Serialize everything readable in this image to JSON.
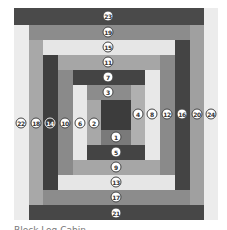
{
  "diagram": {
    "type": "log-cabin-quilt-block",
    "caption": "Block Log Cabin",
    "center": {
      "x": 101,
      "y": 100,
      "w": 30,
      "h": 30,
      "color": "#3c3c3c"
    },
    "strips": [
      {
        "n": "24",
        "x": 204,
        "y": 8,
        "w": 14,
        "h": 212,
        "color": "#ececec",
        "lx": 211,
        "ly": 114
      },
      {
        "n": "23",
        "x": 14,
        "y": 8,
        "w": 190,
        "h": 17,
        "color": "#4a4a4a",
        "lx": 108,
        "ly": 16
      },
      {
        "n": "22",
        "x": 14,
        "y": 25,
        "w": 15,
        "h": 195,
        "color": "#ececec",
        "lx": 21,
        "ly": 123
      },
      {
        "n": "21",
        "x": 29,
        "y": 205,
        "w": 175,
        "h": 15,
        "color": "#474747",
        "lx": 116,
        "ly": 213
      },
      {
        "n": "20",
        "x": 190,
        "y": 25,
        "w": 14,
        "h": 180,
        "color": "#a0a0a0",
        "lx": 197,
        "ly": 114
      },
      {
        "n": "19",
        "x": 29,
        "y": 25,
        "w": 161,
        "h": 15,
        "color": "#8c8c8c",
        "lx": 108,
        "ly": 32
      },
      {
        "n": "18",
        "x": 29,
        "y": 40,
        "w": 14,
        "h": 165,
        "color": "#a8a8a8",
        "lx": 36,
        "ly": 123
      },
      {
        "n": "17",
        "x": 43,
        "y": 190,
        "w": 147,
        "h": 15,
        "color": "#8c8c8c",
        "lx": 116,
        "ly": 197
      },
      {
        "n": "16",
        "x": 175,
        "y": 40,
        "w": 15,
        "h": 150,
        "color": "#444444",
        "lx": 182,
        "ly": 114
      },
      {
        "n": "15",
        "x": 43,
        "y": 40,
        "w": 132,
        "h": 15,
        "color": "#e6e6e6",
        "lx": 108,
        "ly": 47
      },
      {
        "n": "14",
        "x": 43,
        "y": 55,
        "w": 15,
        "h": 135,
        "color": "#3f3f3f",
        "lx": 50,
        "ly": 123,
        "inverted": true
      },
      {
        "n": "13",
        "x": 58,
        "y": 175,
        "w": 117,
        "h": 15,
        "color": "#e6e6e6",
        "lx": 116,
        "ly": 182
      },
      {
        "n": "12",
        "x": 160,
        "y": 55,
        "w": 15,
        "h": 120,
        "color": "#8a8a8a",
        "lx": 167,
        "ly": 114
      },
      {
        "n": "11",
        "x": 58,
        "y": 55,
        "w": 102,
        "h": 15,
        "color": "#a6a6a6",
        "lx": 108,
        "ly": 62
      },
      {
        "n": "10",
        "x": 58,
        "y": 70,
        "w": 15,
        "h": 105,
        "color": "#8a8a8a",
        "lx": 65,
        "ly": 123
      },
      {
        "n": "9",
        "x": 73,
        "y": 160,
        "w": 87,
        "h": 15,
        "color": "#a6a6a6",
        "lx": 116,
        "ly": 167
      },
      {
        "n": "8",
        "x": 145,
        "y": 70,
        "w": 15,
        "h": 90,
        "color": "#e8e8e8",
        "lx": 152,
        "ly": 114
      },
      {
        "n": "7",
        "x": 73,
        "y": 70,
        "w": 72,
        "h": 15,
        "color": "#444444",
        "lx": 108,
        "ly": 77
      },
      {
        "n": "6",
        "x": 73,
        "y": 85,
        "w": 14,
        "h": 75,
        "color": "#e8e8e8",
        "lx": 80,
        "ly": 123
      },
      {
        "n": "5",
        "x": 87,
        "y": 145,
        "w": 58,
        "h": 15,
        "color": "#444444",
        "lx": 116,
        "ly": 152
      },
      {
        "n": "4",
        "x": 131,
        "y": 85,
        "w": 14,
        "h": 60,
        "color": "#b0b0b0",
        "lx": 138,
        "ly": 114
      },
      {
        "n": "3",
        "x": 87,
        "y": 85,
        "w": 44,
        "h": 15,
        "color": "#8c8c8c",
        "lx": 108,
        "ly": 92
      },
      {
        "n": "2",
        "x": 87,
        "y": 100,
        "w": 14,
        "h": 45,
        "color": "#a8a8a8",
        "lx": 94,
        "ly": 123
      },
      {
        "n": "1",
        "x": 101,
        "y": 130,
        "w": 30,
        "h": 15,
        "color": "#7a7a7a",
        "lx": 116,
        "ly": 137
      }
    ]
  }
}
